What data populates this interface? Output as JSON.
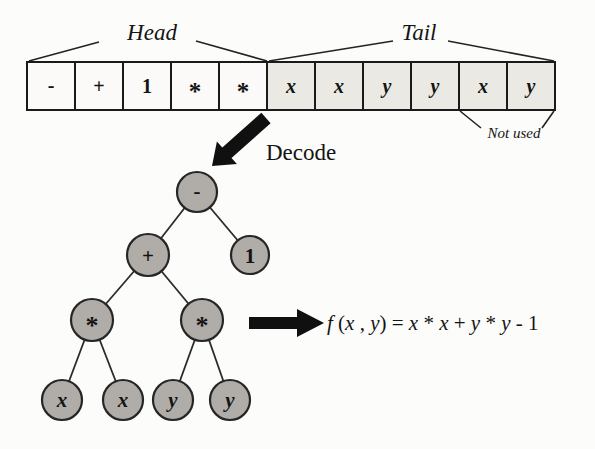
{
  "figure": {
    "decode_label": "Decode",
    "chromosome": {
      "head_label": "Head",
      "tail_label": "Tail",
      "not_used_label": "Not used",
      "cells": [
        {
          "symbol": "-",
          "section": "head",
          "used": true
        },
        {
          "symbol": "+",
          "section": "head",
          "used": true
        },
        {
          "symbol": "1",
          "section": "head",
          "used": true
        },
        {
          "symbol": "*",
          "section": "head",
          "used": true
        },
        {
          "symbol": "*",
          "section": "head",
          "used": true
        },
        {
          "symbol": "x",
          "section": "tail",
          "used": true
        },
        {
          "symbol": "x",
          "section": "tail",
          "used": true
        },
        {
          "symbol": "y",
          "section": "tail",
          "used": true
        },
        {
          "symbol": "y",
          "section": "tail",
          "used": true
        },
        {
          "symbol": "x",
          "section": "tail",
          "used": false
        },
        {
          "symbol": "y",
          "section": "tail",
          "used": false
        }
      ]
    },
    "tree": {
      "nodes": [
        {
          "id": "root-minus",
          "label": "-"
        },
        {
          "id": "plus",
          "label": "+"
        },
        {
          "id": "one",
          "label": "1"
        },
        {
          "id": "mul-left",
          "label": "*"
        },
        {
          "id": "mul-right",
          "label": "*"
        },
        {
          "id": "x1",
          "label": "x"
        },
        {
          "id": "x2",
          "label": "x"
        },
        {
          "id": "y1",
          "label": "y"
        },
        {
          "id": "y2",
          "label": "y"
        }
      ],
      "edges": [
        [
          0,
          1
        ],
        [
          0,
          2
        ],
        [
          1,
          3
        ],
        [
          1,
          4
        ],
        [
          3,
          5
        ],
        [
          3,
          6
        ],
        [
          4,
          7
        ],
        [
          4,
          8
        ]
      ]
    },
    "formula": {
      "text": "f (x , y) = x * x + y * y - 1",
      "parts": [
        "f",
        " (",
        "x",
        " , ",
        "y",
        ") = ",
        "x",
        " * ",
        "x",
        " + ",
        "y",
        " * ",
        "y",
        " - ",
        "1"
      ]
    }
  },
  "colors": {
    "head_cell_fill": "#fbfaf8",
    "tail_cell_fill": "#ebe9e4",
    "node_fill": "#b0ada8",
    "line": "#1f1f1f",
    "arrow": "#101010"
  }
}
